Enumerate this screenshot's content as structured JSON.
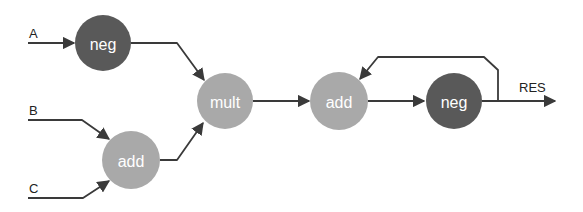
{
  "colors": {
    "dark_node": "#595959",
    "light_node": "#a9a9a9",
    "edge": "#3a3a3a"
  },
  "inputs": [
    {
      "id": "A",
      "label": "A"
    },
    {
      "id": "B",
      "label": "B"
    },
    {
      "id": "C",
      "label": "C"
    }
  ],
  "output": {
    "label": "RES"
  },
  "nodes": [
    {
      "id": "neg1",
      "label": "neg",
      "style": "dark"
    },
    {
      "id": "add1",
      "label": "add",
      "style": "light"
    },
    {
      "id": "mult",
      "label": "mult",
      "style": "light"
    },
    {
      "id": "add2",
      "label": "add",
      "style": "light"
    },
    {
      "id": "neg2",
      "label": "neg",
      "style": "dark"
    }
  ],
  "edges": [
    {
      "from": "A",
      "to": "neg1"
    },
    {
      "from": "B",
      "to": "add1"
    },
    {
      "from": "C",
      "to": "add1"
    },
    {
      "from": "neg1",
      "to": "mult"
    },
    {
      "from": "add1",
      "to": "mult"
    },
    {
      "from": "mult",
      "to": "add2"
    },
    {
      "from": "add2",
      "to": "neg2"
    },
    {
      "from": "neg2",
      "to": "add2",
      "type": "feedback"
    },
    {
      "from": "neg2",
      "to": "RES"
    }
  ]
}
